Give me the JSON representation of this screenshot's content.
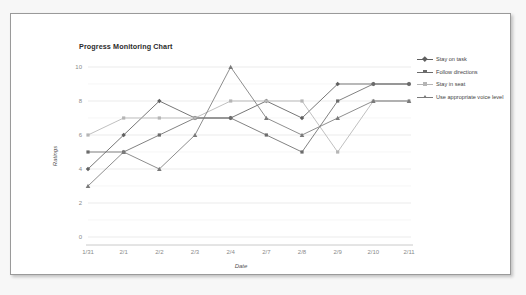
{
  "card": {
    "background_color": "#ffffff",
    "border_color": "#9a9a9a"
  },
  "page": {
    "background_color": "#f7f7f7"
  },
  "chart_data": {
    "type": "line",
    "title": "Progress Monitoring Chart",
    "xlabel": "Date",
    "ylabel": "Ratings",
    "categories": [
      "1/31",
      "2/1",
      "2/2",
      "2/3",
      "2/4",
      "2/7",
      "2/8",
      "2/9",
      "2/10",
      "2/11"
    ],
    "ylim": [
      0,
      10
    ],
    "yticks": [
      0,
      2,
      4,
      6,
      8,
      10
    ],
    "grid": true,
    "grid_axis": "y",
    "legend_position": "right",
    "series": [
      {
        "name": "Stay on task",
        "color": "#5f5f5f",
        "marker": "diamond",
        "values": [
          4,
          6,
          8,
          7,
          7,
          8,
          7,
          9,
          9,
          9
        ]
      },
      {
        "name": "Follow directions",
        "color": "#6b6b6b",
        "marker": "square",
        "values": [
          5,
          5,
          6,
          7,
          7,
          6,
          5,
          8,
          9,
          9
        ]
      },
      {
        "name": "Stay in seat",
        "color": "#b5b5b5",
        "marker": "square-light",
        "values": [
          6,
          7,
          7,
          7,
          8,
          8,
          8,
          5,
          8,
          8
        ]
      },
      {
        "name": "Use appropriate voice level",
        "color": "#7a7a7a",
        "marker": "triangle",
        "values": [
          3,
          5,
          4,
          6,
          10,
          7,
          6,
          7,
          8,
          8
        ]
      }
    ]
  },
  "legend": {
    "items": [
      {
        "label": "Stay on task"
      },
      {
        "label": "Follow directions"
      },
      {
        "label": "Stay in seat"
      },
      {
        "label": "Use appropriate voice level"
      }
    ]
  }
}
